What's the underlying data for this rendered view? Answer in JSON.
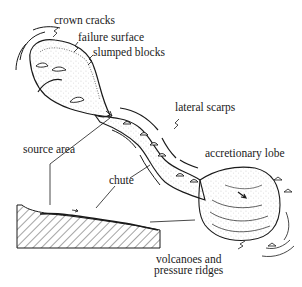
{
  "diagram": {
    "ink_color": "#1a1a1a",
    "background": "#ffffff",
    "labels": {
      "crown_cracks": "crown cracks",
      "failure_surface": "failure surface",
      "slumped_blocks": "slumped blocks",
      "lateral_scarps": "lateral scarps",
      "source_area": "source area",
      "chute": "chute",
      "accretionary_lobe": "accretionary lobe",
      "volcanoes_line1": "volcanoes and",
      "volcanoes_line2": "pressure ridges"
    },
    "parts": [
      {
        "id": "source-area",
        "description": "upper bowl with slumped blocks"
      },
      {
        "id": "chute",
        "description": "narrow channel bordered by lateral scarps"
      },
      {
        "id": "accretionary-lobe",
        "description": "spreading toe with pressure ridges"
      },
      {
        "id": "cross-section",
        "description": "hatched profile of slope in lower left"
      }
    ]
  }
}
